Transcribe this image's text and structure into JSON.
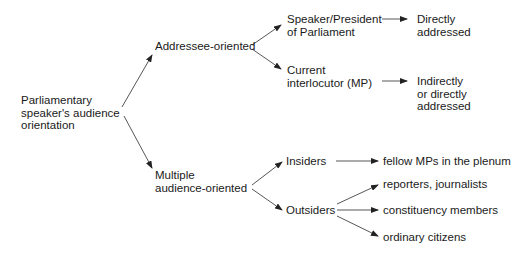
{
  "diagram": {
    "root": {
      "lines": [
        "Parliamentary",
        "speaker's audience",
        "orientation"
      ]
    },
    "level1": {
      "addressee": {
        "lines": [
          "Addressee-oriented"
        ]
      },
      "multiple": {
        "lines": [
          "Multiple",
          "audience-oriented"
        ]
      }
    },
    "level2": {
      "speaker": {
        "lines": [
          "Speaker/President",
          "of Parliament"
        ]
      },
      "interlocutor": {
        "lines": [
          "Current",
          "interlocutor (MP)"
        ]
      },
      "insiders": {
        "lines": [
          "Insiders"
        ]
      },
      "outsiders": {
        "lines": [
          "Outsiders"
        ]
      }
    },
    "level3": {
      "directly": {
        "lines": [
          "Directly",
          "addressed"
        ]
      },
      "indirectly": {
        "lines": [
          "Indirectly",
          "or directly",
          "addressed"
        ]
      },
      "fellow_mps": {
        "lines": [
          "fellow MPs in the plenum"
        ]
      },
      "reporters": {
        "lines": [
          "reporters, journalists"
        ]
      },
      "constituency": {
        "lines": [
          "constituency members"
        ]
      },
      "citizens": {
        "lines": [
          "ordinary citizens"
        ]
      }
    },
    "edges": [
      [
        "root",
        "addressee"
      ],
      [
        "root",
        "multiple"
      ],
      [
        "addressee",
        "speaker"
      ],
      [
        "addressee",
        "interlocutor"
      ],
      [
        "speaker",
        "directly"
      ],
      [
        "interlocutor",
        "indirectly"
      ],
      [
        "multiple",
        "insiders"
      ],
      [
        "multiple",
        "outsiders"
      ],
      [
        "insiders",
        "fellow_mps"
      ],
      [
        "outsiders",
        "reporters"
      ],
      [
        "outsiders",
        "constituency"
      ],
      [
        "outsiders",
        "citizens"
      ]
    ],
    "colors": {
      "text": "#1a1a1a",
      "line": "#333333",
      "background": "#ffffff"
    }
  }
}
